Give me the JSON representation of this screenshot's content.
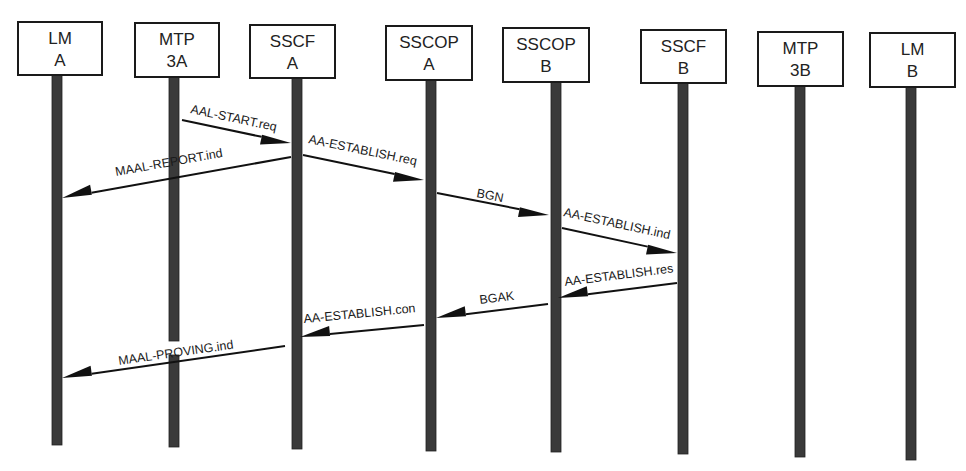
{
  "diagram": {
    "type": "sequence",
    "entities": [
      {
        "id": "lm_a",
        "line1": "LM",
        "line2": "A",
        "x": 57,
        "box": [
          18,
          22,
          84,
          53
        ],
        "bottom": 445
      },
      {
        "id": "mtp_3a",
        "line1": "MTP",
        "line2": "3A",
        "x": 174,
        "box": [
          135,
          23,
          84,
          54
        ],
        "bottom": 447
      },
      {
        "id": "sscf_a",
        "line1": "SSCF",
        "line2": "A",
        "x": 297,
        "box": [
          250,
          25,
          85,
          53
        ],
        "bottom": 449
      },
      {
        "id": "sscop_a",
        "line1": "SSCOP",
        "line2": "A",
        "x": 431,
        "box": [
          386,
          26,
          86,
          54
        ],
        "bottom": 451
      },
      {
        "id": "sscop_b",
        "line1": "SSCOP",
        "line2": "B",
        "x": 556,
        "box": [
          503,
          28,
          86,
          54
        ],
        "bottom": 452
      },
      {
        "id": "sscf_b",
        "line1": "SSCF",
        "line2": "B",
        "x": 683,
        "box": [
          641,
          30,
          85,
          53
        ],
        "bottom": 454
      },
      {
        "id": "mtp_3b",
        "line1": "MTP",
        "line2": "3B",
        "x": 800,
        "box": [
          758,
          32,
          85,
          54
        ],
        "bottom": 457
      },
      {
        "id": "lm_b",
        "line1": "LM",
        "line2": "B",
        "x": 911,
        "box": [
          870,
          33,
          85,
          54
        ],
        "bottom": 460
      }
    ],
    "messages": [
      {
        "label": "AAL-START.req",
        "from": "mtp_3a",
        "to": "sscf_a",
        "x1": 182,
        "y1": 120,
        "x2": 291,
        "y2": 143,
        "label_x": 190,
        "label_y": 113
      },
      {
        "label": "MAAL-REPORT.ind",
        "from": "sscf_a",
        "to": "lm_a",
        "x1": 291,
        "y1": 157,
        "x2": 62,
        "y2": 198,
        "label_x": 116,
        "label_y": 176
      },
      {
        "label": "AA-ESTABLISH.req",
        "from": "sscf_a",
        "to": "sscop_a",
        "x1": 303,
        "y1": 155,
        "x2": 424,
        "y2": 180,
        "label_x": 308,
        "label_y": 143
      },
      {
        "label": "BGN",
        "from": "sscop_a",
        "to": "sscop_b",
        "x1": 437,
        "y1": 193,
        "x2": 549,
        "y2": 215,
        "label_x": 476,
        "label_y": 197
      },
      {
        "label": "AA-ESTABLISH.ind",
        "from": "sscop_b",
        "to": "sscf_b",
        "x1": 562,
        "y1": 228,
        "x2": 677,
        "y2": 253,
        "label_x": 563,
        "label_y": 216
      },
      {
        "label": "AA-ESTABLISH.res",
        "from": "sscf_b",
        "to": "sscop_b",
        "x1": 677,
        "y1": 283,
        "x2": 558,
        "y2": 298,
        "label_x": 565,
        "label_y": 286
      },
      {
        "label": "BGAK",
        "from": "sscop_b",
        "to": "sscop_a",
        "x1": 548,
        "y1": 304,
        "x2": 436,
        "y2": 318,
        "label_x": 480,
        "label_y": 304
      },
      {
        "label": "AA-ESTABLISH.con",
        "from": "sscop_a",
        "to": "sscf_a",
        "x1": 424,
        "y1": 325,
        "x2": 300,
        "y2": 337,
        "label_x": 304,
        "label_y": 323
      },
      {
        "label": "MAAL-PROVING.ind",
        "from": "sscf_a",
        "to": "lm_a",
        "x1": 285,
        "y1": 346,
        "x2": 62,
        "y2": 378,
        "label_x": 119,
        "label_y": 365
      }
    ],
    "gaps": [
      {
        "entity": "mtp_3a",
        "y_start": 341,
        "y_end": 355
      }
    ]
  }
}
